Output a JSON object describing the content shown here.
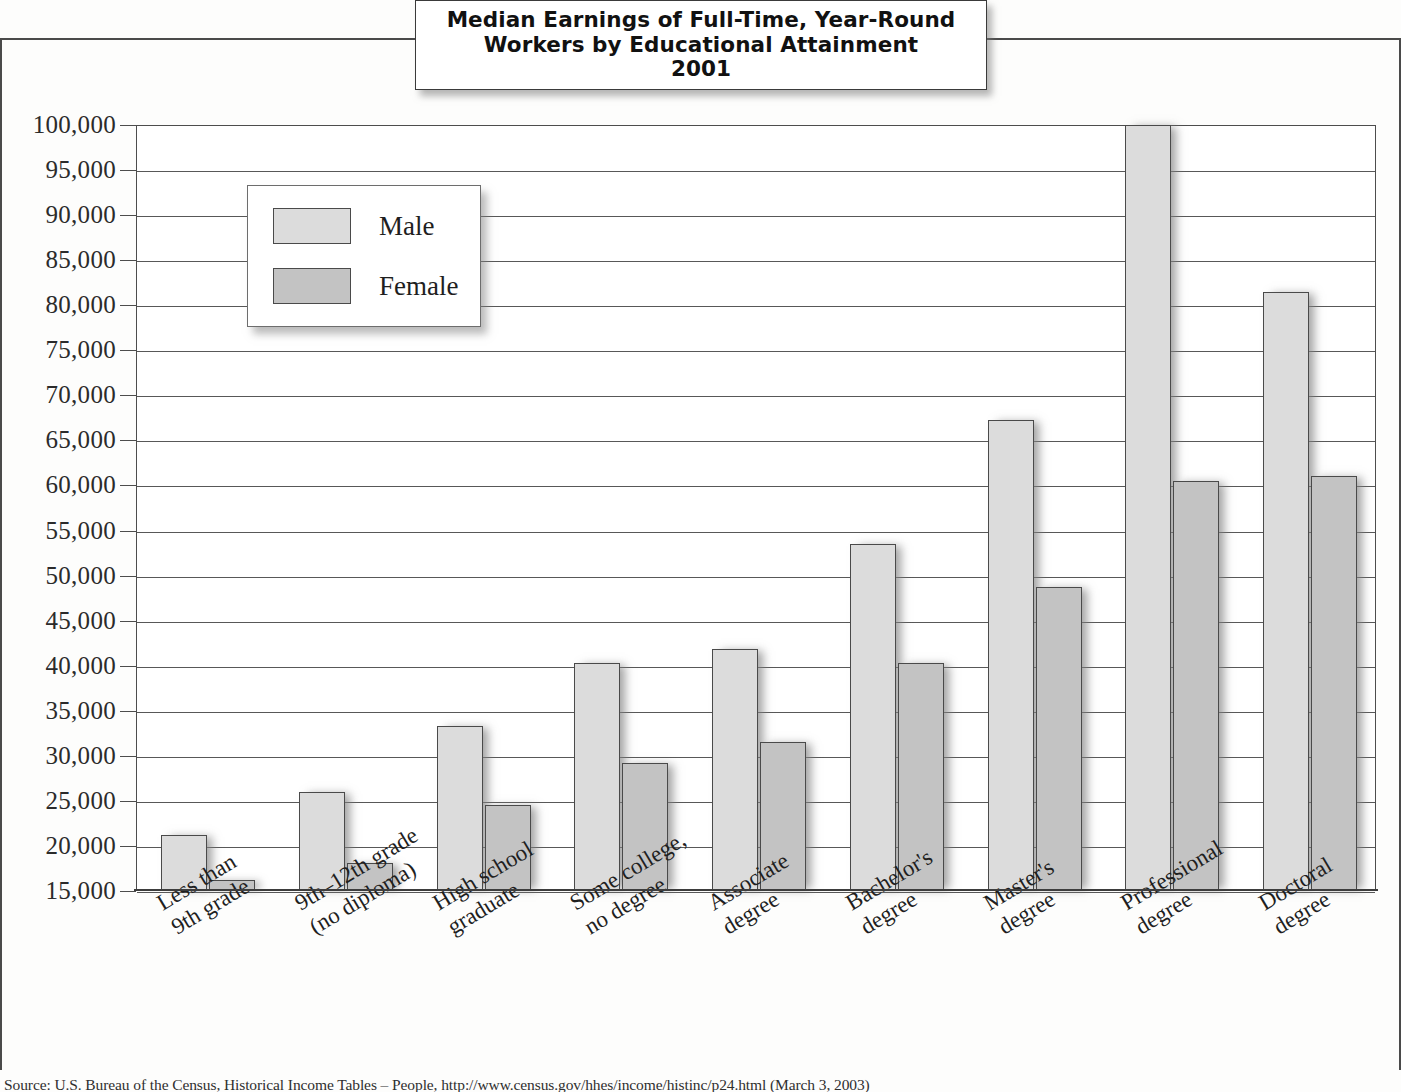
{
  "title": {
    "line1": "Median Earnings of Full-Time, Year-Round",
    "line2": "Workers by Educational Attainment",
    "line3": "2001"
  },
  "legend": {
    "male_label": "Male",
    "female_label": "Female"
  },
  "source": "Source: U.S. Bureau of the Census, Historical Income Tables – People, http://www.census.gov/hhes/income/histinc/p24.html (March 3, 2003)",
  "colors": {
    "male_fill": "#dcdcdc",
    "female_fill": "#c3c3c3",
    "bar_stroke": "#4a4a4a",
    "gridline": "#585858",
    "text": "#1f1f1f"
  },
  "chart_data": {
    "type": "bar",
    "title": "Median Earnings of Full-Time, Year-Round Workers by Educational Attainment 2001",
    "xlabel": "",
    "ylabel": "",
    "ylim": [
      15000,
      100000
    ],
    "ytick_step": 5000,
    "grid": true,
    "legend_position": "inside-upper-left",
    "ytick_labels": [
      "100,000",
      "95,000",
      "90,000",
      "85,000",
      "80,000",
      "75,000",
      "70,000",
      "65,000",
      "60,000",
      "55,000",
      "50,000",
      "45,000",
      "40,000",
      "35,000",
      "30,000",
      "25,000",
      "20,000",
      "15,000"
    ],
    "yticks": [
      100000,
      95000,
      90000,
      85000,
      80000,
      75000,
      70000,
      65000,
      60000,
      55000,
      50000,
      45000,
      40000,
      35000,
      30000,
      25000,
      20000,
      15000
    ],
    "categories": [
      "Less than 9th grade",
      "9th–12th grade (no diploma)",
      "High school graduate",
      "Some college, no degree",
      "Associate degree",
      "Bachelor's degree",
      "Master's degree",
      "Professional degree",
      "Doctoral degree"
    ],
    "category_lines": [
      [
        "Less than",
        "9th grade"
      ],
      [
        "9th–12th grade",
        "(no diploma)"
      ],
      [
        "High school",
        "graduate"
      ],
      [
        "Some college,",
        "no degree"
      ],
      [
        "Associate",
        "degree"
      ],
      [
        "Bachelor's",
        "degree"
      ],
      [
        "Master's",
        "degree"
      ],
      [
        "Professional",
        "degree"
      ],
      [
        "Doctoral",
        "degree"
      ]
    ],
    "series": [
      {
        "name": "Male",
        "values": [
          21200,
          26000,
          33300,
          40300,
          41900,
          53500,
          67300,
          100000,
          81500
        ]
      },
      {
        "name": "Female",
        "values": [
          16200,
          18100,
          24500,
          29200,
          31500,
          40300,
          48700,
          60500,
          61000
        ]
      }
    ]
  }
}
